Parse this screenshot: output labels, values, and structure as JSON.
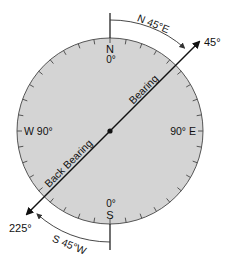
{
  "diagram": {
    "type": "compass-bearing",
    "colors": {
      "dial_fill": "#d4d4d4",
      "dial_stroke": "#555555",
      "line": "#111111",
      "background": "#ffffff"
    },
    "cardinal": {
      "north_letter": "N",
      "north_degrees": "0°",
      "south_letter": "S",
      "south_degrees": "0°",
      "west_label": "W 90°",
      "east_label": "90° E"
    },
    "bearing": {
      "forward_label": "Bearing",
      "forward_degrees": "45°",
      "forward_quadrant": "N 45°E",
      "back_label": "Back Bearing",
      "back_degrees": "225°",
      "back_quadrant": "S 45°W"
    }
  }
}
